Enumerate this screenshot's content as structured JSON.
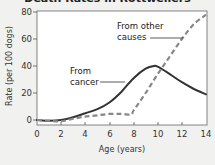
{
  "chart_data": {
    "type": "line",
    "title": "Death Rates in Rottweilers",
    "xlabel": "Age (years)",
    "ylabel": "Rate (per 100 dogs)",
    "xlim": [
      0,
      14
    ],
    "ylim": [
      0,
      80
    ],
    "x_ticks": [
      0,
      2,
      4,
      6,
      8,
      10,
      12,
      14
    ],
    "y_ticks": [
      0,
      20,
      40,
      60,
      80
    ],
    "grid": false,
    "legend": "none (inline annotations)",
    "series": [
      {
        "name": "From cancer",
        "style": "solid",
        "x": [
          0,
          1,
          2,
          3,
          4,
          5,
          6,
          7,
          8,
          9,
          9.7,
          10,
          11,
          12,
          13,
          14
        ],
        "values": [
          0,
          -0.5,
          0,
          2,
          5,
          8,
          13,
          21,
          31,
          38,
          40,
          39.5,
          34,
          28,
          23,
          19
        ]
      },
      {
        "name": "From other causes",
        "style": "dashed",
        "x": [
          0,
          1,
          2,
          3,
          4,
          5,
          6,
          7,
          7.8,
          8,
          9,
          10,
          11,
          12,
          13,
          14
        ],
        "values": [
          0,
          -0.5,
          -1,
          1,
          2.5,
          3.5,
          4.5,
          4.5,
          4,
          7,
          20,
          34,
          47,
          60,
          71,
          78
        ]
      }
    ],
    "annotations": [
      {
        "text_lines": [
          "From other",
          "causes"
        ],
        "points_to": "From other causes",
        "at": [
          11.6,
          52
        ]
      },
      {
        "text_lines": [
          "From",
          "cancer"
        ],
        "points_to": "From cancer",
        "at": [
          6.9,
          31
        ]
      }
    ]
  },
  "ui": {
    "title": "Death Rates in Rottweilers",
    "xlabel": "Age (years)",
    "ylabel": "Rate (per 100 dogs)",
    "annot_other_1": "From other",
    "annot_other_2": "causes",
    "annot_cancer_1": "From",
    "annot_cancer_2": "cancer",
    "xt": [
      "0",
      "2",
      "4",
      "6",
      "8",
      "10",
      "12",
      "14"
    ],
    "yt": [
      "0",
      "20",
      "40",
      "60",
      "80"
    ]
  }
}
